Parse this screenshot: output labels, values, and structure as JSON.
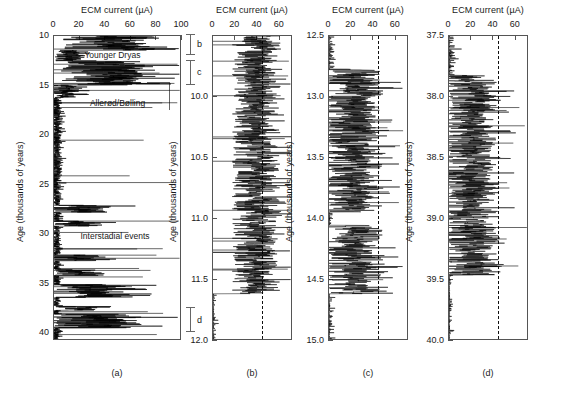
{
  "figure": {
    "caption_a": "(a)",
    "caption_b": "(b)",
    "caption_c": "(c)",
    "caption_d": "(d)"
  },
  "chart_data": [
    {
      "type": "line",
      "panel": "a",
      "title": "ECM current (µA)",
      "xlabel": "ECM current (µA)",
      "ylabel": "Age (thousands of years)",
      "xlim": [
        0,
        100
      ],
      "ylim": [
        10,
        40.8
      ],
      "y_inverted": true,
      "xticks": [
        0,
        20,
        40,
        60,
        80,
        100
      ],
      "xticklabels": [
        "0",
        "20",
        "40",
        "60",
        "80",
        "100"
      ],
      "yticks": [
        10,
        15,
        20,
        25,
        30,
        35,
        40
      ],
      "yticklabels": [
        "10",
        "15",
        "20",
        "25",
        "30",
        "35",
        "40"
      ],
      "grid": false,
      "legend": null,
      "annotations": [
        {
          "text": "Younger Dryas",
          "age": 12.1,
          "value": 48
        },
        {
          "text": "Allerød/Bølling",
          "age": 17.0,
          "value": 52
        },
        {
          "text": "Interstadial events",
          "age": 30.4,
          "value": 50
        }
      ],
      "brackets": [
        {
          "label": "b",
          "age_from": 9.9,
          "age_to": 12.0
        },
        {
          "label": "c",
          "age_from": 12.5,
          "age_to": 15.0
        },
        {
          "label": "d",
          "age_from": 37.5,
          "age_to": 40.0
        }
      ]
    },
    {
      "type": "line",
      "panel": "b",
      "title": "ECM current (µA)",
      "xlabel": "ECM current (µA)",
      "ylabel": "Age (thousands of years)",
      "xlim": [
        0,
        72
      ],
      "ylim": [
        9.5,
        12.0
      ],
      "y_inverted": true,
      "xticks": [
        0,
        20,
        40,
        60
      ],
      "xticklabels": [
        "0",
        "20",
        "40",
        "60"
      ],
      "yticks": [
        10.0,
        10.5,
        11.0,
        11.5,
        12.0
      ],
      "yticklabels": [
        "10.0",
        "10.5",
        "11.0",
        "11.5",
        "12.0"
      ],
      "grid": false,
      "reference_line": {
        "value": 45,
        "style": "dashed"
      }
    },
    {
      "type": "line",
      "panel": "c",
      "title": "ECM current (µA)",
      "xlabel": "ECM current (µA)",
      "ylabel": "Age (thousands of years)",
      "xlim": [
        0,
        72
      ],
      "ylim": [
        12.5,
        15.0
      ],
      "y_inverted": true,
      "xticks": [
        0,
        20,
        40,
        60
      ],
      "xticklabels": [
        "0",
        "20",
        "40",
        "60"
      ],
      "yticks": [
        12.5,
        13.0,
        13.5,
        14.0,
        14.5,
        15.0
      ],
      "yticklabels": [
        "12.5",
        "13.0",
        "13.5",
        "14.0",
        "14.5",
        "15.0"
      ],
      "grid": false,
      "reference_line": {
        "value": 45,
        "style": "dashed"
      }
    },
    {
      "type": "line",
      "panel": "d",
      "title": "ECM current (µA)",
      "xlabel": "ECM current (µA)",
      "ylabel": "Age (thousands of years)",
      "xlim": [
        0,
        72
      ],
      "ylim": [
        37.5,
        40.0
      ],
      "y_inverted": true,
      "xticks": [
        0,
        20,
        40,
        60
      ],
      "xticklabels": [
        "0",
        "20",
        "40",
        "60"
      ],
      "yticks": [
        37.5,
        38.0,
        38.5,
        39.0,
        39.5,
        40.0
      ],
      "yticklabels": [
        "37.5",
        "38.0",
        "38.5",
        "39.0",
        "39.5",
        "40.0"
      ],
      "grid": false,
      "reference_line": {
        "value": 45,
        "style": "dashed"
      }
    }
  ]
}
